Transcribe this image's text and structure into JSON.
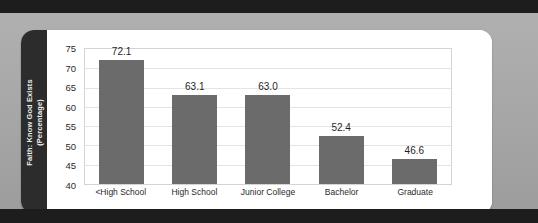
{
  "chart_data": {
    "type": "bar",
    "title": "",
    "xlabel": "",
    "ylabel": "Faith: Know God Exists (Percentage)",
    "ylabel_line1": "Faith: Know God Exists",
    "ylabel_line2": "(Percentage)",
    "categories": [
      "<High School",
      "High School",
      "Junior College",
      "Bachelor",
      "Graduate"
    ],
    "values": [
      72.1,
      63.1,
      63.0,
      52.4,
      46.6
    ],
    "value_labels": [
      "72.1",
      "63.1",
      "63.0",
      "52.4",
      "46.6"
    ],
    "ylim": [
      40,
      75
    ],
    "ytick_labels": [
      "75",
      "70",
      "65",
      "60",
      "55",
      "50",
      "45",
      "40"
    ],
    "ytick_values": [
      75,
      70,
      65,
      60,
      55,
      50,
      45,
      40
    ],
    "grid": true,
    "legend": "none",
    "bar_color": "#6b6b6b",
    "plot_background": "#ffffff",
    "axis_band_color": "#2c2c2c",
    "page_background": "#a9a9a9",
    "gridline_color": "#e4e4e4"
  }
}
